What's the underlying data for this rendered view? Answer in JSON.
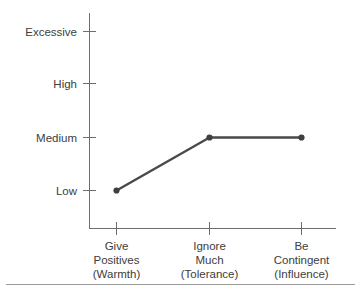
{
  "chart_data": {
    "type": "line",
    "title": "",
    "subtitle": "",
    "xlabel": "",
    "ylabel": "",
    "categories": [
      "Give Positives (Warmth)",
      "Ignore Much (Tolerance)",
      "Be Contingent (Influence)"
    ],
    "category_lines": [
      [
        "Give",
        "Positives",
        "(Warmth)"
      ],
      [
        "Ignore",
        "Much",
        "(Tolerance)"
      ],
      [
        "Be",
        "Contingent",
        "(Influence)"
      ]
    ],
    "y_tick_labels": [
      "Excessive",
      "High",
      "Medium",
      "Low"
    ],
    "y_scale_order_top_to_bottom": [
      "Excessive",
      "High",
      "Medium",
      "Low"
    ],
    "values": [
      "Low",
      "Medium",
      "Medium"
    ],
    "values_numeric": [
      1,
      2,
      2
    ],
    "y_value_map": {
      "Low": 1,
      "Medium": 2,
      "High": 3,
      "Excessive": 4
    },
    "ylim": [
      0,
      4
    ],
    "grid": false,
    "legend": false,
    "legend_position": "none",
    "series": [
      {
        "name": "",
        "values": [
          1,
          2,
          2
        ],
        "value_labels": [
          "Low",
          "Medium",
          "Medium"
        ]
      }
    ],
    "annotations": []
  },
  "style": {
    "line_color": "#4a4a4a",
    "marker_color": "#3f3f3f",
    "axis_color": "#6e6e6e",
    "text_color": "#3d3d3d",
    "divider_color": "#9a9a9a",
    "background_color": "#ffffff"
  },
  "labels": {
    "y0": "Excessive",
    "y1": "High",
    "y2": "Medium",
    "y3": "Low",
    "x0l0": "Give",
    "x0l1": "Positives",
    "x0l2": "(Warmth)",
    "x1l0": "Ignore",
    "x1l1": "Much",
    "x1l2": "(Tolerance)",
    "x2l0": "Be",
    "x2l1": "Contingent",
    "x2l2": "(Influence)"
  }
}
